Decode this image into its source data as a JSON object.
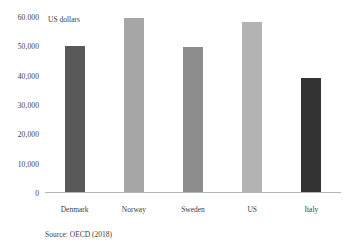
{
  "chart_data": {
    "type": "bar",
    "title": "",
    "subtitle": "",
    "xlabel": "",
    "ylabel": "US dollars",
    "axis_note": "US dollars",
    "categories": [
      "Denmark",
      "Norway",
      "Sweden",
      "US",
      "Italy"
    ],
    "values": [
      50000,
      59500,
      49800,
      58200,
      39200
    ],
    "series": [
      {
        "name": "Average wage",
        "values": [
          50000,
          59500,
          49800,
          58200,
          39200
        ]
      }
    ],
    "bar_colors": [
      "#595959",
      "#a6a6a6",
      "#8c8c8c",
      "#b3b3b3",
      "#333333"
    ],
    "ylim": [
      0,
      60000
    ],
    "y_ticks": [
      {
        "value": 60000,
        "label": "60.000"
      },
      {
        "value": 50000,
        "label": "50,000"
      },
      {
        "value": 40000,
        "label": "40,000"
      },
      {
        "value": 30000,
        "label": "30,000"
      },
      {
        "value": 20000,
        "label": "20,000"
      },
      {
        "value": 10000,
        "label": "10,000"
      },
      {
        "value": 0,
        "label": "0"
      }
    ],
    "grid": false,
    "legend": false,
    "legend_position": "none",
    "annotations": [
      "Source: OECD (2018)"
    ],
    "source": "Source: OECD (2018)"
  },
  "colors": {
    "axis_line": "#b5b5b5",
    "text": "#404040",
    "background": "#ffffff"
  }
}
